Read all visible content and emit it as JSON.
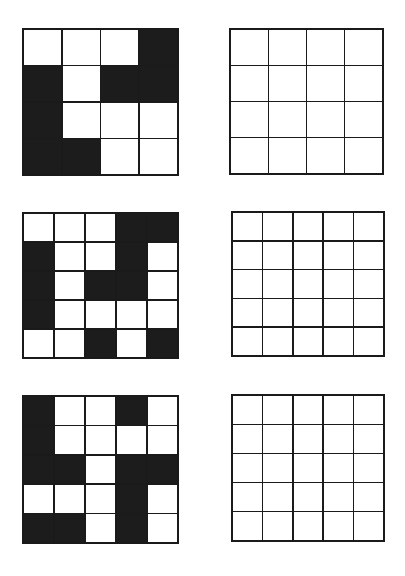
{
  "colors": {
    "filled": "#1c1c1c",
    "empty": "#ffffff",
    "line": "#1a1a1a"
  },
  "puzzles": [
    {
      "id": "puzzle-1",
      "size": 4,
      "pattern": {
        "box": {
          "left": 22,
          "top": 28,
          "width": 157,
          "height": 148
        },
        "cells": [
          [
            0,
            0,
            0,
            1
          ],
          [
            1,
            0,
            1,
            1
          ],
          [
            1,
            0,
            0,
            0
          ],
          [
            1,
            1,
            0,
            0
          ]
        ]
      },
      "answer": {
        "box": {
          "left": 229,
          "top": 28,
          "width": 155,
          "height": 147
        },
        "cells": [
          [
            0,
            0,
            0,
            0
          ],
          [
            0,
            0,
            0,
            0
          ],
          [
            0,
            0,
            0,
            0
          ],
          [
            0,
            0,
            0,
            0
          ]
        ]
      }
    },
    {
      "id": "puzzle-2",
      "size": 5,
      "pattern": {
        "box": {
          "left": 22,
          "top": 212,
          "width": 157,
          "height": 147
        },
        "cells": [
          [
            0,
            0,
            0,
            1,
            1
          ],
          [
            1,
            0,
            0,
            1,
            0
          ],
          [
            1,
            0,
            1,
            1,
            0
          ],
          [
            1,
            0,
            0,
            0,
            0
          ],
          [
            0,
            0,
            1,
            0,
            1
          ]
        ]
      },
      "answer": {
        "box": {
          "left": 231,
          "top": 211,
          "width": 154,
          "height": 146
        },
        "cells": [
          [
            0,
            0,
            0,
            0,
            0
          ],
          [
            0,
            0,
            0,
            0,
            0
          ],
          [
            0,
            0,
            0,
            0,
            0
          ],
          [
            0,
            0,
            0,
            0,
            0
          ],
          [
            0,
            0,
            0,
            0,
            0
          ]
        ]
      }
    },
    {
      "id": "puzzle-3",
      "size": 5,
      "pattern": {
        "box": {
          "left": 22,
          "top": 395,
          "width": 157,
          "height": 149
        },
        "cells": [
          [
            1,
            0,
            0,
            1,
            0
          ],
          [
            1,
            0,
            0,
            0,
            0
          ],
          [
            1,
            1,
            0,
            1,
            1
          ],
          [
            0,
            0,
            0,
            1,
            0
          ],
          [
            1,
            1,
            0,
            1,
            0
          ]
        ]
      },
      "answer": {
        "box": {
          "left": 231,
          "top": 394,
          "width": 154,
          "height": 148
        },
        "cells": [
          [
            0,
            0,
            0,
            0,
            0
          ],
          [
            0,
            0,
            0,
            0,
            0
          ],
          [
            0,
            0,
            0,
            0,
            0
          ],
          [
            0,
            0,
            0,
            0,
            0
          ],
          [
            0,
            0,
            0,
            0,
            0
          ]
        ]
      }
    }
  ]
}
